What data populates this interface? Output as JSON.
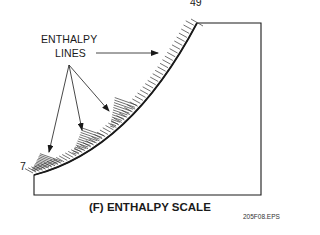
{
  "figure": {
    "title": "(F) ENTHALPY SCALE",
    "file_id": "205F08.EPS",
    "callout": {
      "line1": "ENTHALPY",
      "line2": "LINES"
    },
    "scale": {
      "min_label": "7",
      "max_label": "49"
    },
    "colors": {
      "ink": "#1a1a1a",
      "background": "#ffffff"
    }
  }
}
